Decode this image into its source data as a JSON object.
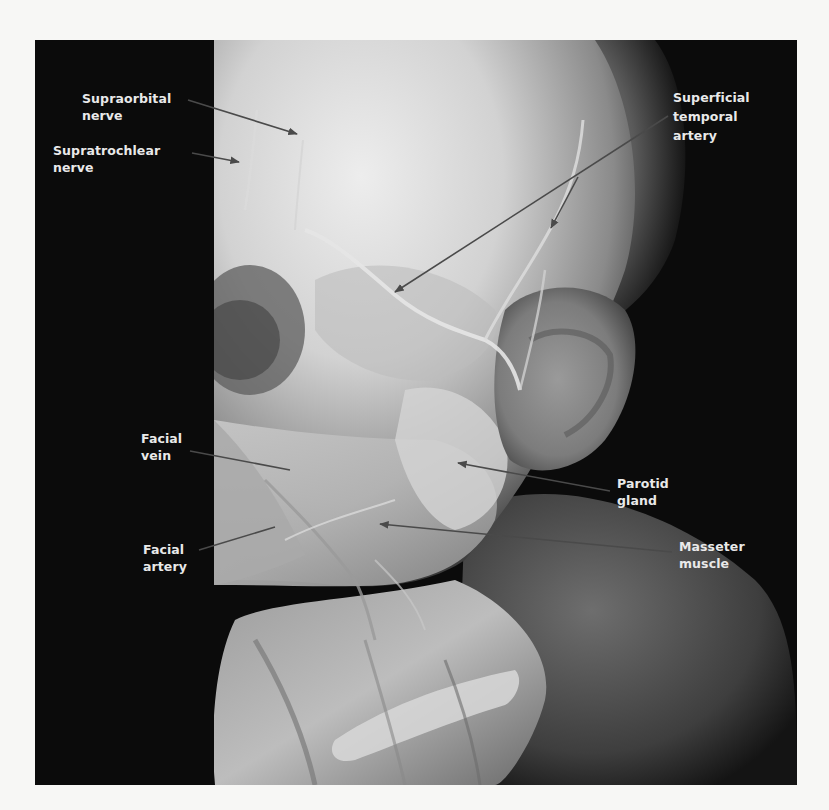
{
  "figure": {
    "colors": {
      "page_background": "#f7f7f5",
      "photo_background": "#0b0b0b",
      "label_text": "#e9e9e9",
      "leader_line": "#4a4a4a"
    }
  },
  "labels": {
    "supraorbital_nerve": {
      "line1": "Supraorbital",
      "line2": "nerve"
    },
    "supratrochlear_nerve": {
      "line1": "Supratrochlear",
      "line2": "nerve"
    },
    "superficial_temporal_artery": {
      "line1": "Superficial",
      "line2": "temporal",
      "line3": "artery"
    },
    "facial_vein": {
      "line1": "Facial",
      "line2": "vein"
    },
    "facial_artery": {
      "line1": "Facial",
      "line2": "artery"
    },
    "parotid_gland": {
      "line1": "Parotid",
      "line2": "gland"
    },
    "masseter_muscle": {
      "line1": "Masseter",
      "line2": "muscle"
    }
  }
}
